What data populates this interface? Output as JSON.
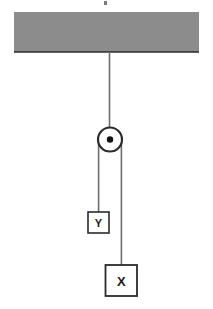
{
  "figure": {
    "width": 213,
    "height": 309,
    "background_color": "#ffffff"
  },
  "colors": {
    "ceiling_fill": "#8c8c8c",
    "ceiling_edge": "#2b2b2b",
    "rope": "#6e6e6e",
    "outline": "#2b2b2b",
    "block_fill": "#ffffff",
    "pulley_fill": "#ffffff",
    "pulley_axle": "#111111",
    "label_text": "#1a1a1a"
  },
  "ceiling": {
    "name": "ceiling",
    "x": 14,
    "y": 12,
    "width": 185,
    "height": 40
  },
  "support_rope": {
    "name": "support-rope",
    "x": 109.5,
    "y_top": 52,
    "y_bottom": 128,
    "width": 1.6
  },
  "pulley": {
    "name": "pulley",
    "cx": 110,
    "cy": 139.5,
    "radius": 12,
    "stroke_width": 2.2,
    "axle_radius": 3.2
  },
  "ropes": [
    {
      "name": "left-rope",
      "x": 98.6,
      "y_top": 139.5,
      "y_bottom": 212,
      "width": 1.6
    },
    {
      "name": "right-rope",
      "x": 121.4,
      "y_top": 139.5,
      "y_bottom": 265,
      "width": 1.6
    }
  ],
  "blocks": [
    {
      "name": "block-y",
      "label": "Y",
      "x": 88,
      "y": 212,
      "width": 21,
      "height": 21,
      "font_size": 11,
      "stroke_width": 1.6
    },
    {
      "name": "block-x",
      "label": "X",
      "x": 105.5,
      "y": 265,
      "width": 31.5,
      "height": 31,
      "font_size": 13,
      "stroke_width": 1.8
    }
  ],
  "top_artifact": {
    "name": "top-crop-artifact",
    "x": 104,
    "y": 1,
    "width": 3,
    "height": 4,
    "color": "#7a7a7a"
  }
}
